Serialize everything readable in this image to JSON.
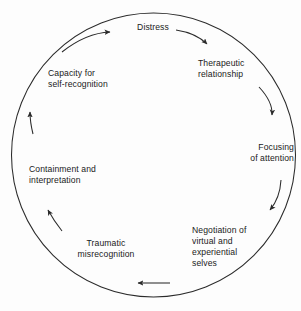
{
  "diagram": {
    "type": "cycle",
    "shape": "circle",
    "direction": "clockwise",
    "stroke_color": "#2b2b2b",
    "text_color": "#1a1a1a",
    "background_color": "#fdfdfd",
    "nodes": [
      {
        "id": "distress",
        "label": "Distress",
        "position": "top"
      },
      {
        "id": "therapeutic",
        "label": "Therapeutic\nrelationship",
        "position": "upper-right"
      },
      {
        "id": "focusing",
        "label": "Focusing\nof attention",
        "position": "right"
      },
      {
        "id": "negotiation",
        "label": "Negotiation of\nvirtual and\nexperiential\nselves",
        "position": "lower-right"
      },
      {
        "id": "traumatic",
        "label": "Traumatic\nmisrecognition",
        "position": "lower-left"
      },
      {
        "id": "containment",
        "label": "Containment and\ninterpretation",
        "position": "left"
      },
      {
        "id": "capacity",
        "label": "Capacity for\nself-recognition",
        "position": "upper-left"
      }
    ],
    "arrows": [
      {
        "id": "arrow-distress-to-therapeutic",
        "from": "distress",
        "to": "therapeutic"
      },
      {
        "id": "arrow-therapeutic-to-focusing",
        "from": "therapeutic",
        "to": "focusing"
      },
      {
        "id": "arrow-focusing-to-negotiation",
        "from": "focusing",
        "to": "negotiation"
      },
      {
        "id": "arrow-negotiation-to-traumatic",
        "from": "negotiation",
        "to": "traumatic"
      },
      {
        "id": "arrow-traumatic-to-containment",
        "from": "traumatic",
        "to": "containment"
      },
      {
        "id": "arrow-containment-to-capacity",
        "from": "containment",
        "to": "capacity"
      },
      {
        "id": "arrow-capacity-to-distress",
        "from": "capacity",
        "to": "distress"
      }
    ]
  }
}
